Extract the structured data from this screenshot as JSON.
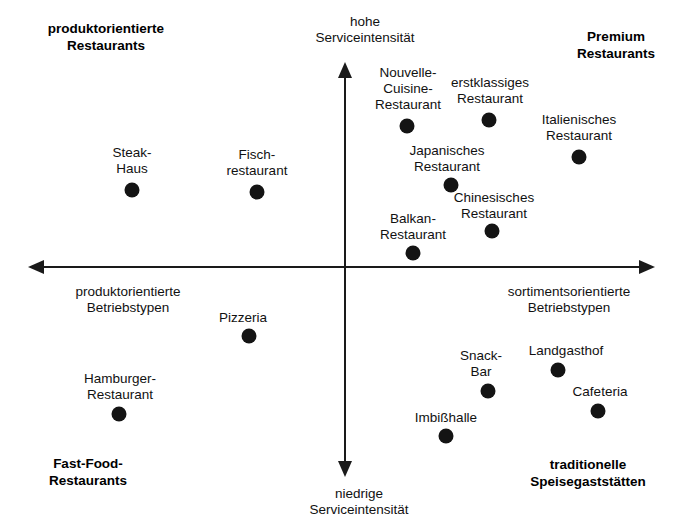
{
  "chart_data": {
    "type": "scatter",
    "title": "",
    "xlabel": "Betriebstypen-Orientierung",
    "ylabel": "Serviceintensität",
    "xlim": [
      0,
      678
    ],
    "ylim": [
      0,
      523
    ],
    "grid": false,
    "legend": "none",
    "axes": {
      "horizontal": {
        "y": 267,
        "x_start": 28,
        "x_end": 655,
        "left_arrow": true,
        "right_arrow": true,
        "left_label": "produktorientierte\nBetriebstypen",
        "right_label": "sortimentsorientierte\nBetriebstypen"
      },
      "vertical": {
        "x": 345,
        "y_top": 62,
        "y_bottom": 477,
        "top_arrow": true,
        "bottom_arrow": true,
        "top_label": "hohe\nServiceintensität",
        "bottom_label": "niedrige\nServiceintensität"
      }
    },
    "quadrant_labels": [
      {
        "text": "produktorientierte\nRestaurants",
        "x": 106,
        "y": 20,
        "quadrant": "top-left"
      },
      {
        "text": "Premium\nRestaurants",
        "x": 616,
        "y": 28,
        "quadrant": "top-right"
      },
      {
        "text": "Fast-Food-\nRestaurants",
        "x": 88,
        "y": 455,
        "quadrant": "bottom-left"
      },
      {
        "text": "traditionelle\nSpeisegaststätten",
        "x": 588,
        "y": 456,
        "quadrant": "bottom-right"
      }
    ],
    "points": [
      {
        "name": "Steak-Haus",
        "label": "Steak-\nHaus",
        "x": 132,
        "y": 190,
        "label_x": 132,
        "label_y": 145
      },
      {
        "name": "Fischrestaurant",
        "label": "Fisch-\nrestaurant",
        "x": 257,
        "y": 192,
        "label_x": 257,
        "label_y": 147
      },
      {
        "name": "Nouvelle-Cuisine-Restaurant",
        "label": "Nouvelle-\nCuisine-\nRestaurant",
        "x": 407,
        "y": 126,
        "label_x": 408,
        "label_y": 65
      },
      {
        "name": "erstklassiges Restaurant",
        "label": "erstklassiges\nRestaurant",
        "x": 489,
        "y": 120,
        "label_x": 490,
        "label_y": 75
      },
      {
        "name": "Italienisches Restaurant",
        "label": "Italienisches\nRestaurant",
        "x": 579,
        "y": 157,
        "label_x": 579,
        "label_y": 112
      },
      {
        "name": "Japanisches Restaurant",
        "label": "Japanisches\nRestaurant",
        "x": 451,
        "y": 185,
        "label_x": 447,
        "label_y": 143
      },
      {
        "name": "Chinesisches Restaurant",
        "label": "Chinesisches\nRestaurant",
        "x": 492,
        "y": 231,
        "label_x": 494,
        "label_y": 190
      },
      {
        "name": "Balkan-Restaurant",
        "label": "Balkan-\nRestaurant",
        "x": 413,
        "y": 253,
        "label_x": 413,
        "label_y": 211
      },
      {
        "name": "Pizzeria",
        "label": "Pizzeria",
        "x": 249,
        "y": 336,
        "label_x": 243,
        "label_y": 310
      },
      {
        "name": "Hamburger-Restaurant",
        "label": "Hamburger-\nRestaurant",
        "x": 119,
        "y": 414,
        "label_x": 120,
        "label_y": 371
      },
      {
        "name": "Snack-Bar",
        "label": "Snack-\nBar",
        "x": 488,
        "y": 391,
        "label_x": 481,
        "label_y": 348
      },
      {
        "name": "Landgasthof",
        "label": "Landgasthof",
        "x": 558,
        "y": 370,
        "label_x": 566,
        "label_y": 343
      },
      {
        "name": "Cafeteria",
        "label": "Cafeteria",
        "x": 598,
        "y": 411,
        "label_x": 600,
        "label_y": 384
      },
      {
        "name": "Imbißhalle",
        "label": "Imbißhalle",
        "x": 446,
        "y": 436,
        "label_x": 446,
        "label_y": 410
      }
    ],
    "colors": {
      "background": "#ffffff",
      "axis": "#1a1a1a",
      "point": "#141414",
      "text": "#111111"
    }
  }
}
